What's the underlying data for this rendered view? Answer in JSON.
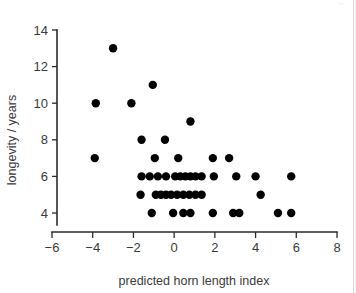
{
  "figure": {
    "background_color": "#ffffff",
    "marker_color": "#000000",
    "axis_color": "#2b2b2b",
    "corner_mark": "''"
  },
  "chart_data": {
    "type": "scatter",
    "title": "",
    "xlabel": "predicted horn length index",
    "ylabel": "longevity / years",
    "xlim": [
      -6,
      8
    ],
    "ylim": [
      3.2,
      14
    ],
    "xticks": [
      -6,
      -4,
      -2,
      0,
      2,
      4,
      6,
      8
    ],
    "xticklabels": [
      "−6",
      "−4",
      "−2",
      "0",
      "2",
      "4",
      "6",
      "8"
    ],
    "yticks": [
      4,
      6,
      8,
      10,
      12,
      14
    ],
    "yticklabels": [
      "4",
      "6",
      "8",
      "10",
      "12",
      "14"
    ],
    "grid": false,
    "legend": "none",
    "marker_size": 4.2,
    "points": [
      [
        -3.0,
        13
      ],
      [
        -1.05,
        11
      ],
      [
        -3.85,
        10
      ],
      [
        -2.1,
        10
      ],
      [
        0.8,
        9
      ],
      [
        -1.6,
        8
      ],
      [
        -0.45,
        8
      ],
      [
        -3.9,
        7
      ],
      [
        -0.95,
        7
      ],
      [
        0.2,
        7
      ],
      [
        1.9,
        7
      ],
      [
        2.7,
        7
      ],
      [
        -1.6,
        6
      ],
      [
        -1.2,
        6
      ],
      [
        -0.8,
        6
      ],
      [
        -0.4,
        6
      ],
      [
        0.05,
        6
      ],
      [
        0.3,
        6
      ],
      [
        0.55,
        6
      ],
      [
        0.8,
        6
      ],
      [
        1.05,
        6
      ],
      [
        1.35,
        6
      ],
      [
        1.95,
        6
      ],
      [
        3.05,
        6
      ],
      [
        4.0,
        6
      ],
      [
        5.75,
        6
      ],
      [
        -1.65,
        5
      ],
      [
        -0.9,
        5
      ],
      [
        -0.65,
        5
      ],
      [
        -0.4,
        5
      ],
      [
        -0.15,
        5
      ],
      [
        0.15,
        5
      ],
      [
        0.45,
        5
      ],
      [
        0.75,
        5
      ],
      [
        1.05,
        5
      ],
      [
        1.35,
        5
      ],
      [
        4.25,
        5
      ],
      [
        -1.1,
        4
      ],
      [
        -0.05,
        4
      ],
      [
        0.45,
        4
      ],
      [
        0.8,
        4
      ],
      [
        1.9,
        4
      ],
      [
        2.9,
        4
      ],
      [
        3.2,
        4
      ],
      [
        5.1,
        4
      ],
      [
        5.75,
        4
      ]
    ]
  }
}
